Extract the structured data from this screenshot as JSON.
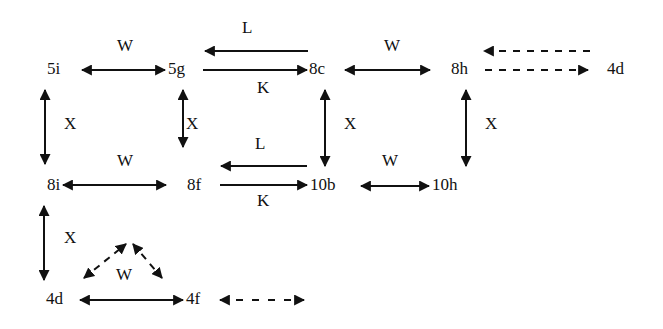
{
  "diagram": {
    "nodes": [
      {
        "id": "5i",
        "label": "5i",
        "x": 47,
        "y": 60
      },
      {
        "id": "5g",
        "label": "5g",
        "x": 170,
        "y": 60
      },
      {
        "id": "8c",
        "label": "8c",
        "x": 310,
        "y": 60
      },
      {
        "id": "8h",
        "label": "8h",
        "x": 451,
        "y": 60
      },
      {
        "id": "4d_top",
        "label": "4d",
        "x": 607,
        "y": 60
      },
      {
        "id": "8i",
        "label": "8i",
        "x": 47,
        "y": 177
      },
      {
        "id": "8f",
        "label": "8f",
        "x": 187,
        "y": 177
      },
      {
        "id": "10b",
        "label": "10b",
        "x": 304,
        "y": 177
      },
      {
        "id": "10h",
        "label": "10h",
        "x": 432,
        "y": 177
      },
      {
        "id": "4d",
        "label": "4d",
        "x": 46,
        "y": 290
      },
      {
        "id": "4f",
        "label": "4f",
        "x": 186,
        "y": 290
      }
    ],
    "edge_labels": [
      {
        "text": "W",
        "x": 117,
        "y": 38
      },
      {
        "text": "L",
        "x": 241,
        "y": 18
      },
      {
        "text": "K",
        "x": 257,
        "y": 78
      },
      {
        "text": "W",
        "x": 384,
        "y": 38
      },
      {
        "text": "X",
        "x": 64,
        "y": 115
      },
      {
        "text": "X",
        "x": 186,
        "y": 115
      },
      {
        "text": "X",
        "x": 344,
        "y": 115
      },
      {
        "text": "X",
        "x": 485,
        "y": 115
      },
      {
        "text": "W",
        "x": 117,
        "y": 152
      },
      {
        "text": "L",
        "x": 255,
        "y": 135
      },
      {
        "text": "K",
        "x": 257,
        "y": 193
      },
      {
        "text": "W",
        "x": 381,
        "y": 152
      },
      {
        "text": "X",
        "x": 64,
        "y": 229
      },
      {
        "text": "W",
        "x": 115,
        "y": 266
      }
    ],
    "edges": [
      {
        "from": "5i",
        "to": "5g",
        "label": "W",
        "type": "bidirectional",
        "style": "solid"
      },
      {
        "from": "8c",
        "to": "5g",
        "label": "L",
        "type": "directed",
        "style": "solid"
      },
      {
        "from": "5g",
        "to": "8c",
        "label": "K",
        "type": "directed",
        "style": "solid"
      },
      {
        "from": "8c",
        "to": "8h",
        "label": "W",
        "type": "bidirectional",
        "style": "solid"
      },
      {
        "from": "4d_top",
        "to": "8h",
        "type": "directed",
        "style": "dashed"
      },
      {
        "from": "8h",
        "to": "4d_top",
        "type": "directed",
        "style": "dashed"
      },
      {
        "from": "5i",
        "to": "8i",
        "label": "X",
        "type": "bidirectional",
        "style": "solid"
      },
      {
        "from": "5g",
        "to": "8f",
        "label": "X",
        "type": "bidirectional",
        "style": "solid"
      },
      {
        "from": "8c",
        "to": "10b",
        "label": "X",
        "type": "bidirectional",
        "style": "solid"
      },
      {
        "from": "8h",
        "to": "10h",
        "label": "X",
        "type": "bidirectional",
        "style": "solid"
      },
      {
        "from": "8i",
        "to": "8f",
        "label": "W",
        "type": "bidirectional",
        "style": "solid"
      },
      {
        "from": "10b",
        "to": "8f",
        "label": "L",
        "type": "directed",
        "style": "solid"
      },
      {
        "from": "8f",
        "to": "10b",
        "label": "K",
        "type": "directed",
        "style": "solid"
      },
      {
        "from": "10b",
        "to": "10h",
        "label": "W",
        "type": "bidirectional",
        "style": "solid"
      },
      {
        "from": "8i",
        "to": "4d",
        "label": "X",
        "type": "bidirectional",
        "style": "solid"
      },
      {
        "from": "4d",
        "to": "4f",
        "label": "W",
        "type": "bidirectional",
        "style": "solid"
      },
      {
        "from": "4d",
        "to": "4f",
        "label": "W",
        "type": "bidirectional-arc",
        "style": "dashed"
      },
      {
        "from": "4f",
        "to": "(off)",
        "type": "bidirectional",
        "style": "dashed"
      }
    ],
    "colors": {
      "ink": "#111111",
      "background": "#ffffff"
    }
  }
}
